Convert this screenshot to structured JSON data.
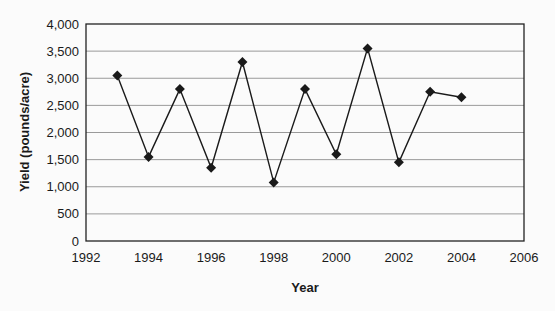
{
  "chart_data": {
    "type": "line",
    "title": "",
    "xlabel": "Year",
    "ylabel": "Yield (pounds/acre)",
    "x": [
      1993,
      1994,
      1995,
      1996,
      1997,
      1998,
      1999,
      2000,
      2001,
      2002,
      2003,
      2004
    ],
    "series": [
      {
        "name": "Yield",
        "values": [
          3050,
          1550,
          2800,
          1350,
          3300,
          1080,
          2800,
          1600,
          3550,
          1450,
          2750,
          2650
        ],
        "marker": "diamond",
        "color": "#1a1a1a"
      }
    ],
    "xlim": [
      1992,
      2006
    ],
    "ylim": [
      0,
      4000
    ],
    "xticks": [
      1992,
      1994,
      1996,
      1998,
      2000,
      2002,
      2004,
      2006
    ],
    "xtick_labels": [
      "1992",
      "1994",
      "1996",
      "1998",
      "2000",
      "2002",
      "2004",
      "2006"
    ],
    "yticks": [
      0,
      500,
      1000,
      1500,
      2000,
      2500,
      3000,
      3500,
      4000
    ],
    "ytick_labels": [
      "0",
      "500",
      "1,000",
      "1,500",
      "2,000",
      "2,500",
      "3,000",
      "3,500",
      "4,000"
    ],
    "grid": {
      "horizontal": true,
      "vertical": false
    },
    "legend": null
  }
}
